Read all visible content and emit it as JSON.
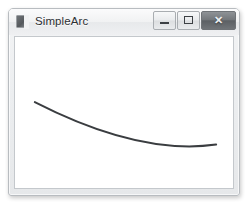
{
  "window": {
    "title": "SimpleArc",
    "icon": "app-window-icon",
    "controls": {
      "minimize_label": "–",
      "maximize_label": "□",
      "close_label": "✕"
    },
    "colors": {
      "frame_border": "#b8bcc0",
      "titlebar_top": "#fbfbfc",
      "titlebar_bottom": "#eff0f2",
      "close_button": "#73777b",
      "client_background": "#ffffff",
      "client_border": "#c4c8cc"
    }
  },
  "chart_data": {
    "type": "line",
    "title": "SimpleArc",
    "xlabel": "",
    "ylabel": "",
    "legend": [],
    "grid": false,
    "xlim": [
      0,
      220
    ],
    "ylim": [
      0,
      153
    ],
    "annotations": [],
    "series": [
      {
        "name": "arc",
        "description": "Open upward-concave arc drawn from upper-left, dipping to a minimum near the horizontal center, rising to the right.",
        "stroke_color": "#3a3d40",
        "stroke_width": 2,
        "path": "M 20 66 Q 125 120 203 109",
        "x": [
          20,
          40,
          60,
          80,
          100,
          120,
          140,
          160,
          180,
          203
        ],
        "y": [
          66,
          78,
          88,
          96,
          103,
          108,
          111,
          112,
          111,
          109
        ],
        "start_point": [
          20,
          66
        ],
        "control_point": [
          125,
          120
        ],
        "end_point": [
          203,
          109
        ]
      }
    ]
  }
}
